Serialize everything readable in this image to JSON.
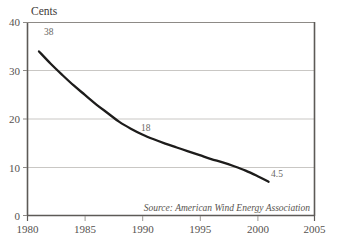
{
  "chart_data": {
    "type": "line",
    "title": "",
    "subtitle": "",
    "xlabel": "",
    "ylabel": "Cents",
    "ylim": [
      0,
      40
    ],
    "xlim": [
      1980,
      2005
    ],
    "grid": true,
    "legend": null,
    "x_ticks": [
      "1980",
      "1985",
      "1990",
      "1995",
      "2000",
      "2005"
    ],
    "y_ticks": [
      "0",
      "10",
      "20",
      "30",
      "40"
    ],
    "series": [
      {
        "name": "Wind energy cost",
        "color": "#1d1c1b",
        "x": [
          1981,
          1982,
          1983,
          1984,
          1985,
          1986,
          1987,
          1988,
          1989,
          1990,
          1991,
          1992,
          1993,
          1994,
          1995,
          1996,
          1997,
          1998,
          1999,
          2000,
          2001
        ],
        "values": [
          34.0,
          31.5,
          29.2,
          27.0,
          25.0,
          23.0,
          21.2,
          19.4,
          18.0,
          16.8,
          15.8,
          14.9,
          14.1,
          13.3,
          12.5,
          11.7,
          11.0,
          10.2,
          9.3,
          8.2,
          7.0
        ]
      }
    ],
    "annotations": [
      {
        "id": "label-38",
        "text": "38",
        "x": 1981,
        "y": 38.0
      },
      {
        "id": "label-18",
        "text": "18",
        "x": 1990,
        "y": 18.0
      },
      {
        "id": "label-4-5",
        "text": "4.5",
        "x": 2001,
        "y": 4.5
      }
    ],
    "source_note": "Source: American Wind Energy Association"
  },
  "axis": {
    "y_unit": "Cents",
    "y_ticks": [
      "40",
      "30",
      "20",
      "10",
      "0"
    ],
    "x_ticks": [
      "1980",
      "1985",
      "1990",
      "1995",
      "2000",
      "2005"
    ]
  },
  "labels": {
    "start": "38",
    "middle": "18",
    "end": "4.5"
  },
  "footer": {
    "source": "Source: American Wind Energy Association"
  },
  "colors": {
    "line": "#1d1c1b",
    "grid": "#c9c7c4",
    "frame": "#5d5a57",
    "text": "#55524f",
    "background": "#ffffff"
  }
}
